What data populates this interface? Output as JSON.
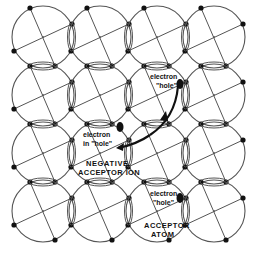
{
  "diagram": {
    "grid": {
      "rows": 4,
      "cols": 4,
      "origin_x": 43,
      "origin_y": 37,
      "spacing_x": 57,
      "spacing_y": 58,
      "radius": 31
    },
    "colors": {
      "line": "#555555",
      "dot": "#111111",
      "background": "#ffffff"
    },
    "labels": {
      "hole1_line1": "electron",
      "hole1_line2": "\"hole\"",
      "electron_in_hole_line1": "electron",
      "electron_in_hole_line2": "in \"hole\"",
      "neg_ion_line1": "NEGATIVE",
      "neg_ion_line2": "ACCEPTOR ION",
      "hole2_line1": "electron",
      "hole2_line2": "\"hole\"",
      "acceptor_line1": "ACCEPTOR",
      "acceptor_line2": "ATOM"
    }
  }
}
